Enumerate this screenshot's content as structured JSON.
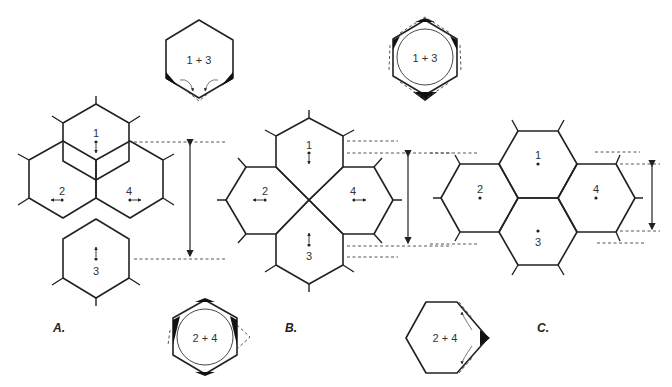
{
  "figure": {
    "panels": [
      {
        "id": "A",
        "label": "A.",
        "cells": [
          "1",
          "2",
          "3",
          "4"
        ],
        "arrows": {
          "1": "down",
          "2": "left",
          "3": "up",
          "4": "right"
        }
      },
      {
        "id": "B",
        "label": "B.",
        "cells": [
          "1",
          "2",
          "3",
          "4"
        ],
        "arrows": {
          "1": "down",
          "2": "left",
          "3": "up",
          "4": "right"
        }
      },
      {
        "id": "C",
        "label": "C.",
        "cells": [
          "1",
          "2",
          "3",
          "4"
        ],
        "arrows": {}
      }
    ],
    "insets": [
      {
        "id": "inset-a-top",
        "label": "1 + 3"
      },
      {
        "id": "inset-b-top",
        "label": "1 + 3"
      },
      {
        "id": "inset-a-bottom",
        "label": "2 + 4"
      },
      {
        "id": "inset-b-bottom",
        "label": "2 + 4"
      }
    ]
  }
}
